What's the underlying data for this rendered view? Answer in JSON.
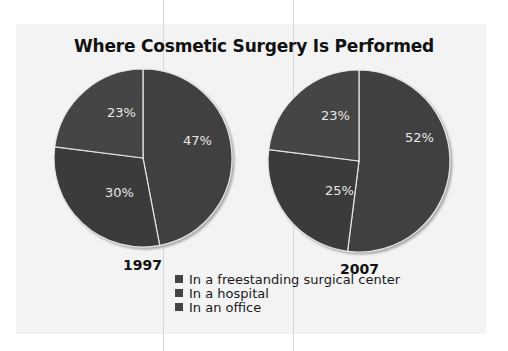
{
  "title": "Where Cosmetic Surgery Is Performed",
  "legend": [
    {
      "label": "In a freestanding surgical center",
      "color": "#414141"
    },
    {
      "label": "In a hospital",
      "color": "#3a3a3a"
    },
    {
      "label": "In an office",
      "color": "#454545"
    }
  ],
  "pies": [
    {
      "year": "1997",
      "labels": [
        "47%",
        "30%",
        "23%"
      ]
    },
    {
      "year": "2007",
      "labels": [
        "52%",
        "25%",
        "23%"
      ]
    }
  ],
  "chart_data": {
    "type": "pie",
    "title": "Where Cosmetic Surgery Is Performed",
    "categories": [
      "In a freestanding surgical center",
      "In a hospital",
      "In an office"
    ],
    "series": [
      {
        "name": "1997",
        "values": [
          47,
          30,
          23
        ]
      },
      {
        "name": "2007",
        "values": [
          52,
          25,
          23
        ]
      }
    ],
    "legend_position": "bottom-center",
    "unit": "%"
  }
}
